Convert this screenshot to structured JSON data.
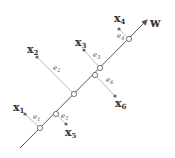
{
  "diagram": {
    "axis": {
      "label": "w",
      "from": [
        20,
        148
      ],
      "to": [
        147,
        20
      ],
      "label_pos": [
        150,
        27
      ],
      "color": "#555555"
    },
    "points": [
      {
        "name": "x",
        "sub": "1",
        "dot": [
          25,
          114
        ],
        "proj": [
          40,
          128
        ],
        "label_pos": [
          13,
          111
        ],
        "err": "e",
        "err_sub": "1",
        "err_pos": [
          33,
          119
        ]
      },
      {
        "name": "x",
        "sub": "2",
        "dot": [
          37,
          57
        ],
        "proj": [
          74,
          94
        ],
        "label_pos": [
          27,
          53
        ],
        "err": "e",
        "err_sub": "2",
        "err_pos": [
          53,
          70
        ]
      },
      {
        "name": "x",
        "sub": "3",
        "dot": [
          84,
          50
        ],
        "proj": [
          100,
          68
        ],
        "label_pos": [
          75,
          46
        ],
        "err": "e",
        "err_sub": "3",
        "err_pos": [
          93,
          57
        ]
      },
      {
        "name": "x",
        "sub": "4",
        "dot": [
          119,
          29
        ],
        "proj": [
          129,
          39
        ],
        "label_pos": [
          114,
          22
        ],
        "err": "e",
        "err_sub": "4",
        "err_pos": [
          117,
          38
        ]
      },
      {
        "name": "x",
        "sub": "5",
        "dot": [
          66,
          124
        ],
        "proj": [
          56,
          114
        ],
        "label_pos": [
          65,
          136
        ],
        "err": "e",
        "err_sub": "5",
        "err_pos": [
          61,
          118
        ]
      },
      {
        "name": "x",
        "sub": "6",
        "dot": [
          115,
          96
        ],
        "proj": [
          95,
          75
        ],
        "label_pos": [
          115,
          107
        ],
        "err": "e",
        "err_sub": "6",
        "err_pos": [
          106,
          82
        ]
      }
    ]
  }
}
